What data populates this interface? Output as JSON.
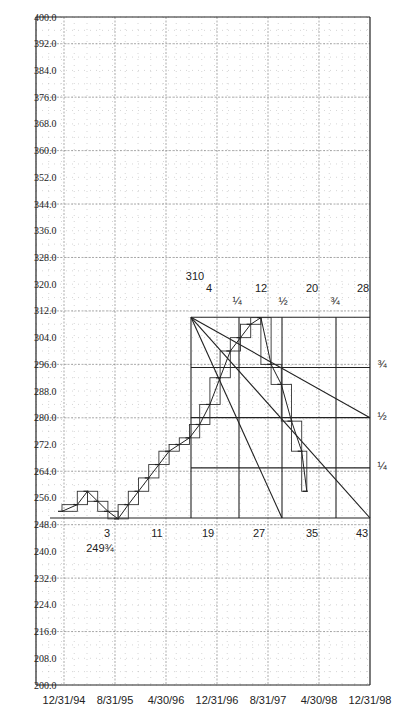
{
  "chart_data": {
    "type": "line",
    "title": "",
    "xlabel": "",
    "ylabel": "",
    "ylim": [
      200,
      400
    ],
    "y_ticks": [
      "400.0",
      "392.0",
      "384.0",
      "376.0",
      "368.0",
      "360.0",
      "352.0",
      "344.0",
      "336.0",
      "328.0",
      "320.0",
      "312.0",
      "304.0",
      "296.0",
      "288.0",
      "280.0",
      "272.0",
      "264.0",
      "256.0",
      "248.0",
      "240.0",
      "232.0",
      "224.0",
      "216.0",
      "208.0",
      "200.0"
    ],
    "x_ticks": [
      "12/31/94",
      "8/31/95",
      "4/30/96",
      "12/31/96",
      "8/31/97",
      "4/30/98",
      "12/31/98"
    ],
    "grid": true,
    "series": [
      {
        "name": "price",
        "style": "step bars",
        "points": [
          {
            "x": 0.0,
            "y": 252
          },
          {
            "x": 0.3,
            "y": 254
          },
          {
            "x": 0.5,
            "y": 258
          },
          {
            "x": 0.7,
            "y": 255
          },
          {
            "x": 0.9,
            "y": 252
          },
          {
            "x": 1.1,
            "y": 249.75
          },
          {
            "x": 1.3,
            "y": 254
          },
          {
            "x": 1.5,
            "y": 258
          },
          {
            "x": 1.7,
            "y": 262
          },
          {
            "x": 1.9,
            "y": 266
          },
          {
            "x": 2.1,
            "y": 270
          },
          {
            "x": 2.3,
            "y": 272
          },
          {
            "x": 2.5,
            "y": 274
          },
          {
            "x": 2.7,
            "y": 278
          },
          {
            "x": 2.9,
            "y": 284
          },
          {
            "x": 3.1,
            "y": 292
          },
          {
            "x": 3.3,
            "y": 300
          },
          {
            "x": 3.5,
            "y": 304
          },
          {
            "x": 3.7,
            "y": 308
          },
          {
            "x": 3.9,
            "y": 310
          },
          {
            "x": 4.1,
            "y": 296
          },
          {
            "x": 4.3,
            "y": 290
          },
          {
            "x": 4.5,
            "y": 279
          },
          {
            "x": 4.7,
            "y": 270
          },
          {
            "x": 4.8,
            "y": 258
          }
        ]
      }
    ],
    "speed_resistance": {
      "apex": {
        "date_index": 3.9,
        "price": 310
      },
      "low": 249.75,
      "fan_lines": [
        "apex to 1/2-time bottom",
        "apex to full-time bottom",
        "apex to full-time 1/2-price"
      ],
      "price_fractions": [
        "3/4",
        "1/2",
        "1/4"
      ],
      "time_fractions": [
        "1/4",
        "1/2",
        "3/4"
      ]
    },
    "annotations": {
      "top_labels": [
        {
          "text": "310",
          "x": 195,
          "y": 280
        },
        {
          "text": "4",
          "x": 209,
          "y": 292
        },
        {
          "text": "12",
          "x": 261,
          "y": 292
        },
        {
          "text": "20",
          "x": 312,
          "y": 292
        },
        {
          "text": "28",
          "x": 363,
          "y": 292
        }
      ],
      "top_fractions": [
        {
          "text": "¼",
          "x": 237,
          "y": 305
        },
        {
          "text": "½",
          "x": 283,
          "y": 305
        },
        {
          "text": "¾",
          "x": 335,
          "y": 305
        }
      ],
      "right_fractions": [
        {
          "text": "¾",
          "x": 382,
          "y": 368
        },
        {
          "text": "½",
          "x": 382,
          "y": 420
        },
        {
          "text": "¼",
          "x": 382,
          "y": 470
        }
      ],
      "bottom_labels": [
        {
          "text": "3",
          "x": 107,
          "y": 537
        },
        {
          "text": "2493/4",
          "display": "249¾",
          "x": 100,
          "y": 552
        },
        {
          "text": "11",
          "x": 157,
          "y": 537
        },
        {
          "text": "19",
          "x": 208,
          "y": 537
        },
        {
          "text": "27",
          "x": 259,
          "y": 537
        },
        {
          "text": "35",
          "x": 312,
          "y": 537
        },
        {
          "text": "43",
          "x": 362,
          "y": 537
        }
      ]
    }
  }
}
